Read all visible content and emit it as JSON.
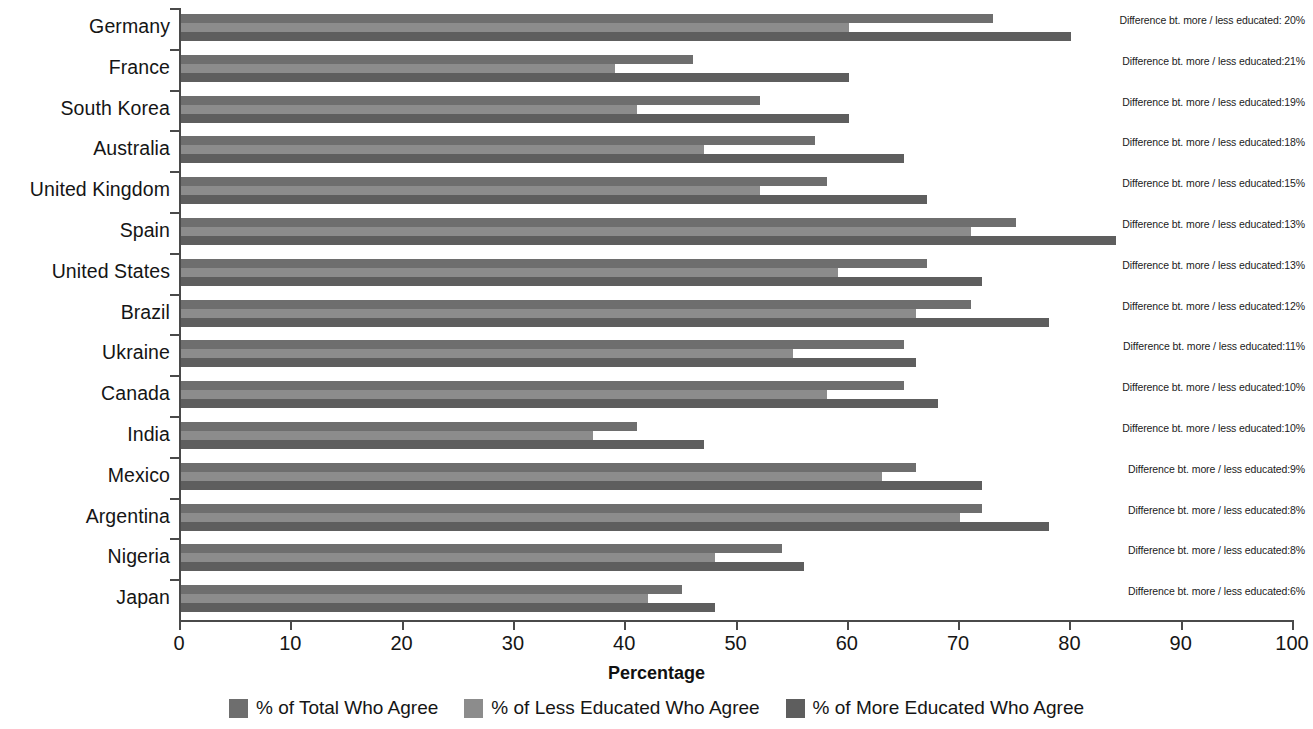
{
  "chart_data": {
    "type": "bar",
    "title": "",
    "xlabel": "Percentage",
    "ylabel": "",
    "xlim": [
      0,
      100
    ],
    "xticks": [
      0,
      10,
      20,
      30,
      40,
      50,
      60,
      70,
      80,
      90,
      100
    ],
    "grid": false,
    "orientation": "horizontal",
    "legend_position": "bottom",
    "categories": [
      "Germany",
      "France",
      "South Korea",
      "Australia",
      "United Kingdom",
      "Spain",
      "United States",
      "Brazil",
      "Ukraine",
      "Canada",
      "India",
      "Mexico",
      "Argentina",
      "Nigeria",
      "Japan"
    ],
    "series": [
      {
        "name": "% of Total Who Agree",
        "color": "#6e6e6e",
        "values": [
          73,
          46,
          52,
          57,
          58,
          75,
          67,
          71,
          65,
          65,
          41,
          66,
          72,
          54,
          45
        ]
      },
      {
        "name": "% of Less Educated Who Agree",
        "color": "#8c8c8c",
        "values": [
          60,
          39,
          41,
          47,
          52,
          71,
          59,
          66,
          55,
          58,
          37,
          63,
          70,
          48,
          42
        ]
      },
      {
        "name": "% of More Educated Who Agree",
        "color": "#5e5e5e",
        "values": [
          80,
          60,
          60,
          65,
          67,
          84,
          72,
          78,
          66,
          68,
          47,
          72,
          78,
          56,
          48
        ]
      }
    ],
    "annotations": [
      "Difference bt. more / less educated: 20%",
      "Difference bt. more / less educated:21%",
      "Difference bt. more / less educated:19%",
      "Difference bt. more / less educated:18%",
      "Difference bt. more / less educated:15%",
      "Difference bt. more / less educated:13%",
      "Difference bt. more / less educated:13%",
      "Difference bt. more / less educated:12%",
      "Difference bt. more / less educated:11%",
      "Difference bt. more / less educated:10%",
      "Difference bt. more / less educated:10%",
      "Difference bt. more / less educated:9%",
      "Difference bt. more / less educated:8%",
      "Difference bt. more / less educated:8%",
      "Difference bt. more / less educated:6%"
    ]
  },
  "axis": {
    "x_title": "Percentage",
    "tick_labels": [
      "0",
      "10",
      "20",
      "30",
      "40",
      "50",
      "60",
      "70",
      "80",
      "90",
      "100"
    ]
  },
  "legend": {
    "items": [
      {
        "label": "% of Total Who Agree",
        "color": "#6e6e6e"
      },
      {
        "label": "% of Less Educated Who Agree",
        "color": "#8c8c8c"
      },
      {
        "label": "% of More Educated Who Agree",
        "color": "#5e5e5e"
      }
    ]
  },
  "colors": {
    "total": "#6e6e6e",
    "less_educated": "#8c8c8c",
    "more_educated": "#5e5e5e",
    "axis": "#4a4a4a",
    "text": "#151515",
    "background": "#ffffff"
  }
}
